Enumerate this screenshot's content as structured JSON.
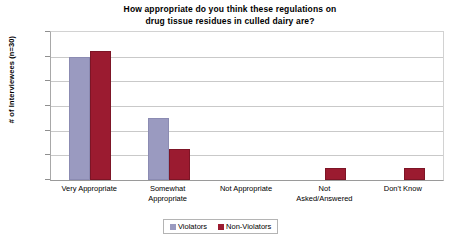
{
  "chart_data": {
    "type": "bar",
    "title": "How appropriate do you think these regulations on\ndrug tissue residues in culled dairy are?",
    "title_line1": "How appropriate do you think these regulations on",
    "title_line2": "drug tissue residues in culled dairy are?",
    "xlabel": "",
    "ylabel": "# of Interviewees (n=30)",
    "ylim": [
      0,
      12
    ],
    "ytick_values": [
      0,
      2,
      4,
      6,
      8,
      10,
      12
    ],
    "ytick_labels": [
      "0",
      "2",
      "4",
      "6",
      "8",
      "10",
      "12"
    ],
    "grid": true,
    "legend_position": "bottom",
    "categories": [
      "Very Appropriate",
      "Somewhat\nAppropriate",
      "Not Appropriate",
      "Not\nAsked/Answered",
      "Don't Know"
    ],
    "series": [
      {
        "name": "Violators",
        "color": "#9a9ac0",
        "values": [
          10,
          5,
          0,
          0,
          0
        ]
      },
      {
        "name": "Non-Violators",
        "color": "#9b1b30",
        "values": [
          10.5,
          2.5,
          0,
          1,
          1
        ]
      }
    ]
  },
  "legend": {
    "items": [
      {
        "label": "Violators",
        "color": "#9a9ac0"
      },
      {
        "label": "Non-Violators",
        "color": "#9b1b30"
      }
    ]
  }
}
